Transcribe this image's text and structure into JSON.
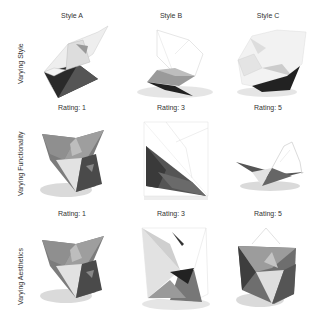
{
  "figure": {
    "rows": [
      {
        "label": "Varying Style",
        "columns": [
          {
            "caption": "Style A",
            "render": "folded-polyhedron-style-a"
          },
          {
            "caption": "Style B",
            "render": "folded-polyhedron-style-b"
          },
          {
            "caption": "Style C",
            "render": "folded-polyhedron-style-c"
          }
        ]
      },
      {
        "label": "Varying Functionality",
        "columns": [
          {
            "caption": "Rating: 1",
            "render": "star-polyhedron-functionality-1"
          },
          {
            "caption": "Rating: 3",
            "render": "wireframe-polyhedron-functionality-3"
          },
          {
            "caption": "Rating: 5",
            "render": "flat-folded-functionality-5"
          }
        ]
      },
      {
        "label": "Varying Aesthetics",
        "columns": [
          {
            "caption": "Rating: 1",
            "render": "star-polyhedron-aesthetics-1"
          },
          {
            "caption": "Rating: 3",
            "render": "octahedral-aesthetics-3"
          },
          {
            "caption": "Rating: 5",
            "render": "star-polyhedron-aesthetics-5"
          }
        ]
      }
    ]
  }
}
